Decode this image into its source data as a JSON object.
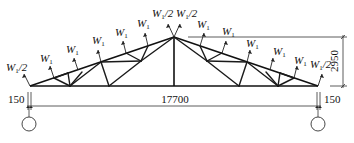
{
  "diagram": {
    "title": "",
    "type": "roof truss load diagram",
    "loads": {
      "half_label": "W1/2",
      "full_label": "W1",
      "symbol": "W",
      "subscript": "1",
      "half_suffix": "/2"
    },
    "load_list": [
      {
        "id": "L0",
        "label": "W1/2",
        "side": "left",
        "x": 22,
        "y": 68
      },
      {
        "id": "L1",
        "label": "W1",
        "side": "left",
        "x": 44,
        "y": 59
      },
      {
        "id": "L2",
        "label": "W1",
        "side": "left",
        "x": 68,
        "y": 50
      },
      {
        "id": "L3",
        "label": "W1",
        "side": "left",
        "x": 94,
        "y": 42
      },
      {
        "id": "L4",
        "label": "W1",
        "side": "left",
        "x": 118,
        "y": 34
      },
      {
        "id": "L5",
        "label": "W1",
        "side": "left",
        "x": 142,
        "y": 26
      },
      {
        "id": "L6",
        "label": "W1/2",
        "side": "apex-left",
        "x": 162,
        "y": 16
      },
      {
        "id": "L7",
        "label": "W1/2",
        "side": "apex-right",
        "x": 187,
        "y": 16
      },
      {
        "id": "L8",
        "label": "W1",
        "side": "right",
        "x": 203,
        "y": 27
      },
      {
        "id": "L9",
        "label": "W1",
        "side": "right",
        "x": 228,
        "y": 34
      },
      {
        "id": "L10",
        "label": "W1",
        "side": "right",
        "x": 250,
        "y": 45
      },
      {
        "id": "L11",
        "label": "W1",
        "side": "right",
        "x": 274,
        "y": 53
      },
      {
        "id": "L12",
        "label": "W1",
        "side": "right",
        "x": 296,
        "y": 61
      },
      {
        "id": "L13",
        "label": "W1/2",
        "side": "right",
        "x": 320,
        "y": 68
      }
    ],
    "dimensions": {
      "span": "17700",
      "height": "2950",
      "left_offset": "150",
      "right_offset": "150"
    },
    "supports": [
      {
        "name": "left-support",
        "type": "column-circle"
      },
      {
        "name": "right-support",
        "type": "column-circle"
      }
    ],
    "colors": {
      "line": "#111111",
      "background": "#ffffff"
    }
  }
}
